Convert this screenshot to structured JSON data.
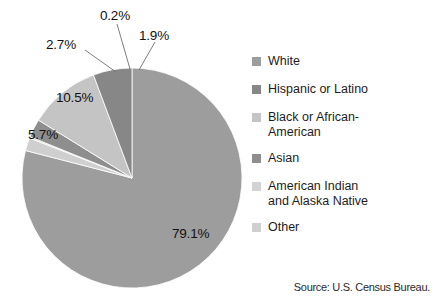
{
  "chart_data": {
    "type": "pie",
    "title": "",
    "categories": [
      "White",
      "Hispanic or Latino",
      "Black or African-American",
      "Asian",
      "American Indian and Alaska Native",
      "Other"
    ],
    "values": [
      79.1,
      5.7,
      10.5,
      2.7,
      0.2,
      1.9
    ],
    "value_labels": [
      "79.1%",
      "5.7%",
      "10.5%",
      "2.7%",
      "0.2%",
      "1.9%"
    ],
    "colors": [
      "#9d9d9d",
      "#878787",
      "#c4c4c4",
      "#8e8e8e",
      "#d2d2d2",
      "#cfcfcf"
    ],
    "units": "percent",
    "legend_position": "right",
    "grid": false,
    "annotations": [
      "Source: U.S. Census Bureau."
    ]
  },
  "pie": {
    "slices": [
      {
        "name": "White",
        "label": "79.1%",
        "value": 79.1,
        "color": "#9d9d9d",
        "label_placement": "inside"
      },
      {
        "name": "Other",
        "label": "1.9%",
        "value": 1.9,
        "color": "#cfcfcf",
        "label_placement": "callout"
      },
      {
        "name": "American Indian and Alaska Native",
        "label": "0.2%",
        "value": 0.2,
        "color": "#d2d2d2",
        "label_placement": "callout"
      },
      {
        "name": "Asian",
        "label": "2.7%",
        "value": 2.7,
        "color": "#8e8e8e",
        "label_placement": "callout"
      },
      {
        "name": "Black or African-American",
        "label": "10.5%",
        "value": 10.5,
        "color": "#c4c4c4",
        "label_placement": "inside"
      },
      {
        "name": "Hispanic or Latino",
        "label": "5.7%",
        "value": 5.7,
        "color": "#878787",
        "label_placement": "inside"
      }
    ]
  },
  "legend": {
    "items": [
      {
        "label": "White",
        "color": "#9d9d9d"
      },
      {
        "label": "Hispanic or Latino",
        "color": "#878787"
      },
      {
        "label": "Black or African-\nAmerican",
        "color": "#c4c4c4"
      },
      {
        "label": "Asian",
        "color": "#8e8e8e"
      },
      {
        "label": "American Indian\nand Alaska Native",
        "color": "#d2d2d2"
      },
      {
        "label": "Other",
        "color": "#cfcfcf"
      }
    ]
  },
  "source": {
    "text": "Source: U.S. Census Bureau."
  }
}
